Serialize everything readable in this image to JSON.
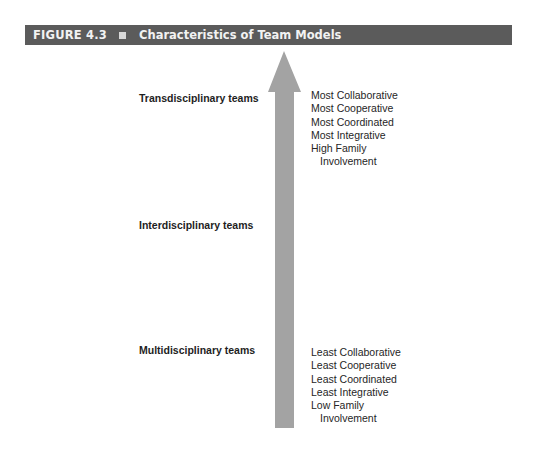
{
  "figure": {
    "label": "FIGURE 4.3",
    "title": "Characteristics of Team Models",
    "header_color": "#5b5b5b",
    "arrow_color": "#a3a3a3",
    "arrow_direction": "up"
  },
  "teams": [
    {
      "label": "Transdisciplinary teams"
    },
    {
      "label": "Interdisciplinary teams"
    },
    {
      "label": "Multidisciplinary teams"
    }
  ],
  "top_characteristics": [
    "Most Collaborative",
    "Most Cooperative",
    "Most Coordinated",
    "Most Integrative",
    "High Family",
    "Involvement"
  ],
  "bottom_characteristics": [
    "Least Collaborative",
    "Least Cooperative",
    "Least Coordinated",
    "Least Integrative",
    "Low Family",
    "Involvement"
  ]
}
